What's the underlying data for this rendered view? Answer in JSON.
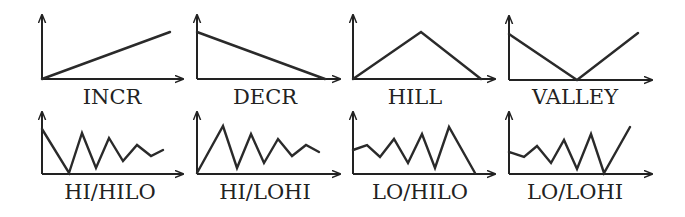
{
  "figure": {
    "stroke_color": "#222222",
    "background": "#ffffff"
  },
  "panels": [
    {
      "id": "incr",
      "label": "INCR",
      "row": 0,
      "axis": {
        "ox": 42,
        "oy": 79,
        "ytop": 15,
        "xend": 183
      },
      "points": [
        [
          42,
          79
        ],
        [
          170,
          32
        ]
      ],
      "label_x": 112,
      "label_y": 104
    },
    {
      "id": "decr",
      "label": "DECR",
      "row": 0,
      "axis": {
        "ox": 197,
        "oy": 79,
        "ytop": 15,
        "xend": 340
      },
      "points": [
        [
          197,
          32
        ],
        [
          325,
          79
        ]
      ],
      "label_x": 265,
      "label_y": 104
    },
    {
      "id": "hill",
      "label": "HILL",
      "row": 0,
      "axis": {
        "ox": 353,
        "oy": 79,
        "ytop": 15,
        "xend": 495
      },
      "points": [
        [
          353,
          79
        ],
        [
          421,
          32
        ],
        [
          481,
          79
        ]
      ],
      "label_x": 415,
      "label_y": 104
    },
    {
      "id": "valley",
      "label": "VALLEY",
      "row": 0,
      "axis": {
        "ox": 509,
        "oy": 80,
        "ytop": 16,
        "xend": 652
      },
      "points": [
        [
          509,
          34
        ],
        [
          577,
          80
        ],
        [
          638,
          33
        ]
      ],
      "label_x": 575,
      "label_y": 104
    },
    {
      "id": "hi-hilo",
      "label": "HI/HILO",
      "row": 1,
      "axis": {
        "ox": 42,
        "oy": 174,
        "ytop": 112,
        "xend": 183
      },
      "points": [
        [
          42,
          129
        ],
        [
          69,
          173
        ],
        [
          82,
          133
        ],
        [
          96,
          168
        ],
        [
          109,
          138
        ],
        [
          123,
          161
        ],
        [
          137,
          145
        ],
        [
          151,
          156
        ],
        [
          163,
          150
        ]
      ],
      "label_x": 110,
      "label_y": 199
    },
    {
      "id": "hi-lohi",
      "label": "HI/LOHI",
      "row": 1,
      "axis": {
        "ox": 197,
        "oy": 174,
        "ytop": 112,
        "xend": 340
      },
      "points": [
        [
          197,
          173
        ],
        [
          223,
          126
        ],
        [
          237,
          168
        ],
        [
          251,
          134
        ],
        [
          264,
          163
        ],
        [
          278,
          139
        ],
        [
          292,
          156
        ],
        [
          306,
          145
        ],
        [
          319,
          152
        ]
      ],
      "label_x": 265,
      "label_y": 199
    },
    {
      "id": "lo-hilo",
      "label": "LO/HILO",
      "row": 1,
      "axis": {
        "ox": 353,
        "oy": 174,
        "ytop": 112,
        "xend": 495
      },
      "points": [
        [
          353,
          150
        ],
        [
          367,
          145
        ],
        [
          380,
          157
        ],
        [
          394,
          139
        ],
        [
          408,
          163
        ],
        [
          422,
          134
        ],
        [
          435,
          168
        ],
        [
          449,
          127
        ],
        [
          475,
          173
        ]
      ],
      "label_x": 420,
      "label_y": 199
    },
    {
      "id": "lo-lohi",
      "label": "LO/LOHI",
      "row": 1,
      "axis": {
        "ox": 509,
        "oy": 174,
        "ytop": 112,
        "xend": 652
      },
      "points": [
        [
          509,
          152
        ],
        [
          524,
          157
        ],
        [
          537,
          146
        ],
        [
          551,
          163
        ],
        [
          564,
          140
        ],
        [
          577,
          169
        ],
        [
          591,
          134
        ],
        [
          604,
          173
        ],
        [
          630,
          127
        ]
      ],
      "label_x": 575,
      "label_y": 199
    }
  ]
}
